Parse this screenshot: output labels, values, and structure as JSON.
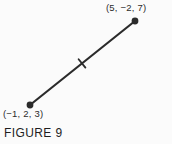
{
  "figure": {
    "caption": "FIGURE 9",
    "background_color": "#fbfbfb",
    "stroke_color": "#2b2b2b",
    "text_color": "#2b2b2b"
  },
  "labels": {
    "upper_point": "(5, −2, 7)",
    "lower_point": "(−1, 2, 3)"
  },
  "diagram_data": {
    "type": "line-segment",
    "description": "A straight line segment in 3-space joining two labeled endpoints, with a midpoint tick mark.",
    "endpoints": [
      {
        "name": "lower-left-endpoint",
        "label": "(−1, 2, 3)",
        "coordinates_3d": [
          -1,
          2,
          3
        ],
        "pixel": [
          30,
          105
        ]
      },
      {
        "name": "upper-right-endpoint",
        "label": "(5, −2, 7)",
        "coordinates_3d": [
          5,
          -2,
          7
        ],
        "pixel": [
          135,
          21
        ]
      }
    ],
    "midpoint_marker": {
      "name": "midpoint-tick",
      "pixel": [
        82,
        63
      ],
      "shape": "short perpendicular tick across the segment"
    },
    "segment": {
      "stroke_width": 2.2,
      "dot_radius": 3.4
    }
  }
}
